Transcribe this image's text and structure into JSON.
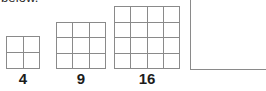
{
  "figure": {
    "caption_fragment": "below.",
    "line_color": "#8a8a8a",
    "label_color": "#1c1c1c",
    "background": "#ffffff"
  },
  "shapes": [
    {
      "name": "square-grid-2x2",
      "rows": 2,
      "columns": 2,
      "cell_count": 4,
      "label": "4"
    },
    {
      "name": "square-grid-3x3",
      "rows": 3,
      "columns": 3,
      "cell_count": 9,
      "label": "9"
    },
    {
      "name": "square-grid-4x4",
      "rows": 4,
      "columns": 4,
      "cell_count": 16,
      "label": "16"
    },
    {
      "name": "partial-square-next-term",
      "rows": 0,
      "columns": 0,
      "cell_count": 0,
      "label": ""
    }
  ],
  "chart_data": {
    "type": "table",
    "title": "",
    "categories": [
      "4",
      "9",
      "16"
    ],
    "values": [
      4,
      9,
      16
    ],
    "xlabel": "",
    "ylabel": ""
  }
}
